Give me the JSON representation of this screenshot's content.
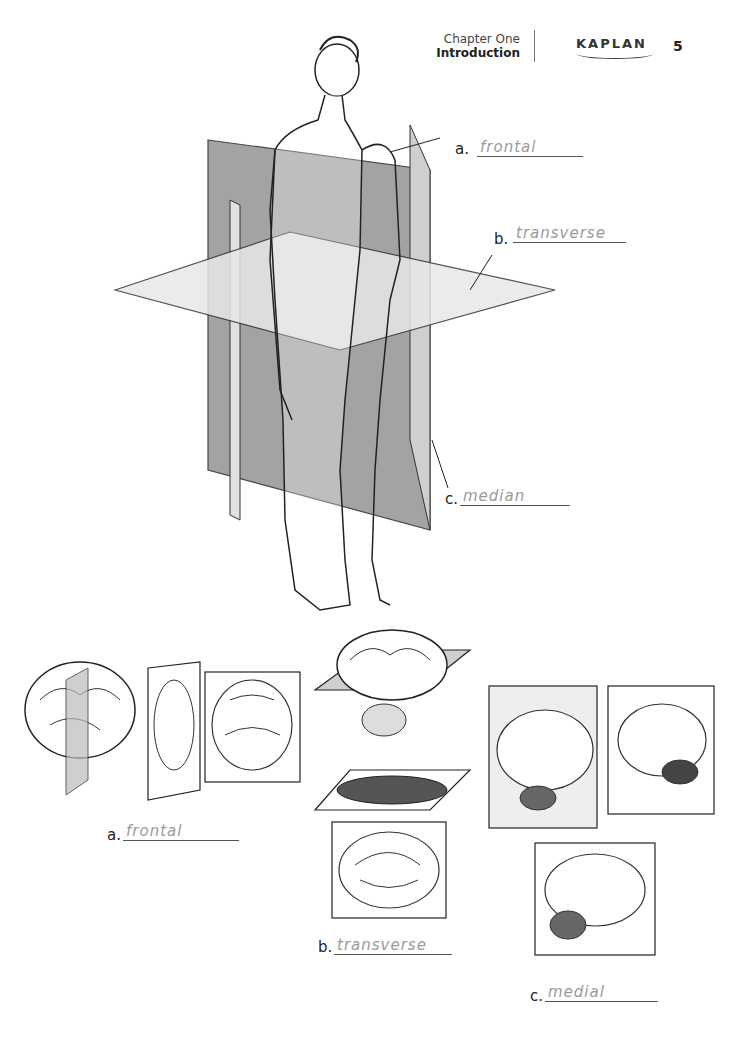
{
  "header": {
    "chapter": "Chapter One",
    "section": "Introduction",
    "brand": "KAPLAN",
    "page_number": "5"
  },
  "figure_body": {
    "labels": [
      {
        "letter": "a.",
        "answer": "frontal"
      },
      {
        "letter": "b.",
        "answer": "transverse"
      },
      {
        "letter": "c.",
        "answer": "median"
      }
    ]
  },
  "figure_brains": {
    "labels": [
      {
        "letter": "a.",
        "answer": "frontal"
      },
      {
        "letter": "b.",
        "answer": "transverse"
      },
      {
        "letter": "c.",
        "answer": "medial"
      }
    ]
  }
}
